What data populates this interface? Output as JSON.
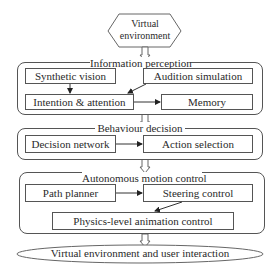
{
  "diagram": {
    "start_node": {
      "label_line1": "Virtual",
      "label_line2": "environment",
      "shape": "hexagon"
    },
    "groups": [
      {
        "title": "Information perception",
        "boxes": [
          {
            "label": "Synthetic vision"
          },
          {
            "label": "Audition simulation"
          },
          {
            "label": "Intention & attention"
          },
          {
            "label": "Memory"
          }
        ]
      },
      {
        "title": "Behaviour decision",
        "boxes": [
          {
            "label": "Decision network"
          },
          {
            "label": "Action selection"
          }
        ]
      },
      {
        "title": "Autonomous motion control",
        "boxes": [
          {
            "label": "Path planner"
          },
          {
            "label": "Steering control"
          },
          {
            "label": "Physics-level animation control"
          }
        ]
      }
    ],
    "end_node": {
      "label": "Virtual environment and user interaction",
      "shape": "ellipse"
    },
    "edges": [
      {
        "from": "Virtual environment",
        "to": "Information perception",
        "style": "hollow-double-arrow"
      },
      {
        "from": "Synthetic vision",
        "to": "Intention & attention"
      },
      {
        "from": "Audition simulation",
        "to": "Intention & attention"
      },
      {
        "from": "Intention & attention",
        "to": "Memory"
      },
      {
        "from": "Information perception",
        "to": "Behaviour decision",
        "style": "hollow-double-arrow"
      },
      {
        "from": "Decision network",
        "to": "Action selection"
      },
      {
        "from": "Behaviour decision",
        "to": "Autonomous motion control",
        "style": "hollow-double-arrow"
      },
      {
        "from": "Path planner",
        "to": "Steering control"
      },
      {
        "from": "Steering control",
        "to": "Physics-level animation control"
      },
      {
        "from": "Autonomous motion control",
        "to": "Virtual environment and user interaction",
        "style": "hollow-double-arrow"
      }
    ],
    "colors": {
      "line": "#555555",
      "text": "#2a2a2a",
      "background": "#ffffff"
    }
  }
}
